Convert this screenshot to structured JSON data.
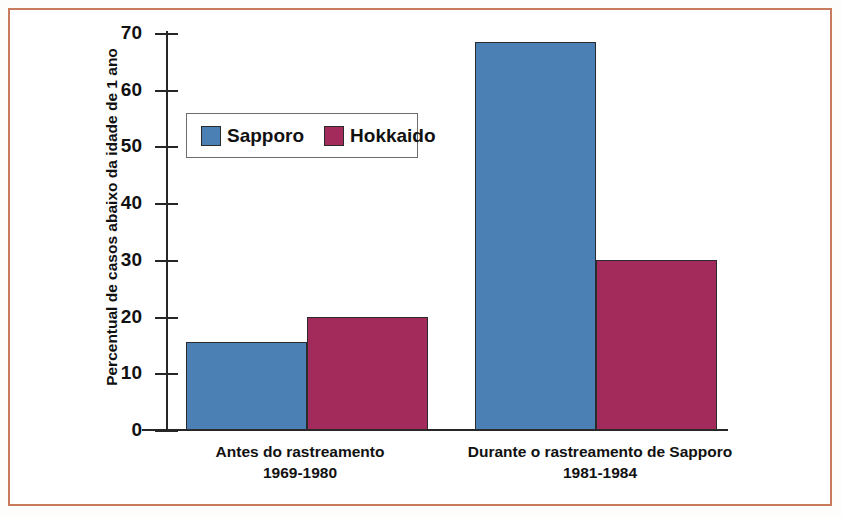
{
  "chart_data": {
    "type": "bar",
    "title": "",
    "subtitle": "",
    "xlabel": "",
    "ylabel": "Percentual de casos abaixo da idade de 1 ano",
    "ylim": [
      0,
      70
    ],
    "ytick_step": 10,
    "yticks": [
      "70",
      "60",
      "50",
      "40",
      "30",
      "20",
      "10",
      "0"
    ],
    "ytick_values": [
      70,
      60,
      50,
      40,
      30,
      20,
      10,
      0
    ],
    "grid": false,
    "legend_position": "upper-left-inside",
    "categories": [
      {
        "line1": "Antes do rastreamento",
        "line2": "1969-1980"
      },
      {
        "line1": "Durante o rastreamento de Sapporo",
        "line2": "1981-1984"
      }
    ],
    "series": [
      {
        "name": "Sapporo",
        "color": "#4a80b4",
        "values": [
          15.5,
          68.5
        ]
      },
      {
        "name": "Hokkaido",
        "color": "#a32b5c",
        "values": [
          20,
          30
        ]
      }
    ],
    "annotations": []
  },
  "legend": {
    "items": [
      {
        "label": "Sapporo",
        "swatch": "blue-square-swatch"
      },
      {
        "label": "Hokkaido",
        "swatch": "maroon-square-swatch"
      }
    ]
  },
  "colors": {
    "sapporo": "#4a80b4",
    "hokkaido": "#a32b5c",
    "frame_border": "#c9795c",
    "axis": "#262626",
    "text": "#111111",
    "legend_border": "#6d6d6d",
    "background": "#ffffff"
  }
}
